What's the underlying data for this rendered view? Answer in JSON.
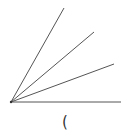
{
  "diagram": {
    "type": "angle-rays",
    "origin": {
      "x": 11,
      "y": 102
    },
    "stroke_color": "#555555",
    "rays": [
      {
        "id": "ray-1",
        "end": {
          "x": 64,
          "y": 8
        }
      },
      {
        "id": "ray-2",
        "end": {
          "x": 94,
          "y": 32
        }
      },
      {
        "id": "ray-3",
        "end": {
          "x": 114,
          "y": 64
        }
      },
      {
        "id": "ray-4",
        "end": {
          "x": 121,
          "y": 102
        }
      }
    ],
    "label": {
      "text": "(",
      "x": 62,
      "y": 115
    }
  }
}
